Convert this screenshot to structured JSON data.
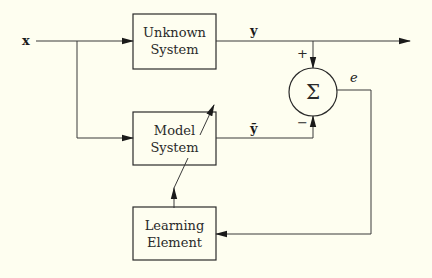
{
  "diagram": {
    "type": "block-diagram",
    "blocks": {
      "unknown": {
        "line1": "Unknown",
        "line2": "System"
      },
      "model": {
        "line1": "Model",
        "line2": "System"
      },
      "learning": {
        "line1": "Learning",
        "line2": "Element"
      }
    },
    "summer": {
      "symbol": "Σ",
      "plus_sign": "+",
      "minus_sign": "−"
    },
    "signals": {
      "input": "x",
      "output": "y",
      "model_output": "ỹ",
      "error": "e"
    },
    "connections": [
      {
        "from": "x",
        "to": "Unknown System"
      },
      {
        "from": "x",
        "to": "Model System"
      },
      {
        "from": "Unknown System",
        "to": "output y"
      },
      {
        "from": "y",
        "to": "Σ",
        "sign": "+"
      },
      {
        "from": "Model System",
        "to": "Σ",
        "sign": "−",
        "signal": "ỹ"
      },
      {
        "from": "Σ",
        "to": "Learning Element",
        "signal": "e"
      },
      {
        "from": "Learning Element",
        "to": "Model System",
        "kind": "adaptation"
      }
    ],
    "colors": {
      "background": "#fefef0",
      "ink": "#2a2a2a"
    }
  }
}
